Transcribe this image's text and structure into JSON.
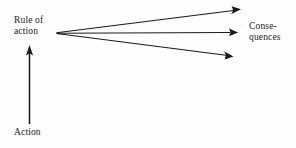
{
  "figure": {
    "type": "flow-diagram",
    "background_color": "#fefefe",
    "ink_color": "#1a1a1a",
    "nodes": {
      "action": {
        "label": "Action",
        "lines": [
          "Action"
        ]
      },
      "rule_of_action": {
        "label": "Rule of action",
        "lines": [
          "Rule of",
          "action"
        ]
      },
      "consequences": {
        "label": "Consequences",
        "lines": [
          "Conse-",
          "quences"
        ]
      }
    },
    "arrows": {
      "vertical": {
        "name": "action-to-rule-arrow",
        "from": "action",
        "to": "rule_of_action",
        "direction": "up"
      },
      "fan": {
        "name": "rule-to-consequences-arrows",
        "from": "rule_of_action",
        "to": "consequences",
        "count": 3,
        "direction": "right"
      }
    }
  }
}
